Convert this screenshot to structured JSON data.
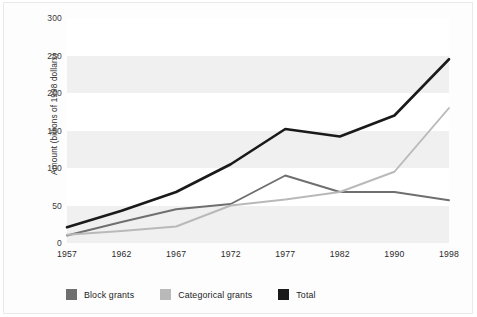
{
  "chart_data": {
    "type": "line",
    "title": "",
    "xlabel": "",
    "ylabel": "Amount (billions of 1998 dollars)",
    "categories": [
      "1957",
      "1962",
      "1967",
      "1972",
      "1977",
      "1982",
      "1990",
      "1998"
    ],
    "yticks": [
      0,
      50,
      100,
      150,
      200,
      250,
      300
    ],
    "ylim": [
      0,
      300
    ],
    "grid": "horizontal-alternating-bands",
    "legend_position": "bottom-left",
    "series": [
      {
        "name": "Block grants",
        "color": "#6f6f6f",
        "values": [
          10,
          28,
          45,
          52,
          90,
          68,
          68,
          57
        ]
      },
      {
        "name": "Categorical grants",
        "color": "#b9b9b9",
        "values": [
          11,
          16,
          22,
          50,
          58,
          68,
          95,
          180
        ]
      },
      {
        "name": "Total",
        "color": "#1a1a1a",
        "values": [
          21,
          43,
          68,
          105,
          152,
          142,
          170,
          245
        ]
      }
    ]
  },
  "axes": {
    "y_title": "Amount (billions of 1998 dollars)",
    "y_tick_labels": [
      "300",
      "250",
      "200",
      "150",
      "100",
      "50",
      "0"
    ],
    "x_tick_labels": [
      "1957",
      "1962",
      "1967",
      "1972",
      "1977",
      "1982",
      "1990",
      "1998"
    ]
  },
  "legend": {
    "items": [
      {
        "label": "Block grants",
        "color": "#6f6f6f"
      },
      {
        "label": "Categorical grants",
        "color": "#b9b9b9"
      },
      {
        "label": "Total",
        "color": "#1a1a1a"
      }
    ]
  },
  "colors": {
    "background": "#ffffff",
    "plot_band_shaded": "#f0f0f0",
    "plot_band_light": "#ffffff",
    "frame_border": "#e9e9e9",
    "tick_text": "#2b2b2b"
  }
}
